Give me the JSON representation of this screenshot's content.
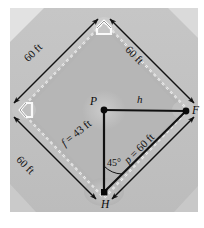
{
  "figure": {
    "kind": "baseball-diamond-geometry-diagram",
    "colors": {
      "page_background": "#ffffff",
      "photo_background": "#c8c8c8",
      "outfield_grass": "#bdbdbd",
      "infield_dirt": "#b0b0b0",
      "corner_light": "#dcdcdc",
      "line_color": "#111111",
      "base_path_dashes": "#f0f0f0"
    },
    "dimension_labels": [
      {
        "id": "top-left-side",
        "text": "60 ft"
      },
      {
        "id": "top-right-side",
        "text": "60 ft"
      },
      {
        "id": "bottom-left-side",
        "text": "60 ft"
      }
    ],
    "segment_labels": [
      {
        "id": "f-side",
        "prefix": "f",
        "text": " = 43 ft",
        "full": "f = 43 ft"
      },
      {
        "id": "p-side",
        "prefix": "p",
        "text": " = 60 ft",
        "full": "p = 60 ft"
      },
      {
        "id": "h-side",
        "prefix": "h",
        "text": "",
        "full": "h"
      }
    ],
    "angle_label": "45°",
    "vertices": [
      {
        "id": "pitcher",
        "label": "P"
      },
      {
        "id": "first-base",
        "label": "F"
      },
      {
        "id": "home-plate",
        "label": "H"
      }
    ]
  }
}
